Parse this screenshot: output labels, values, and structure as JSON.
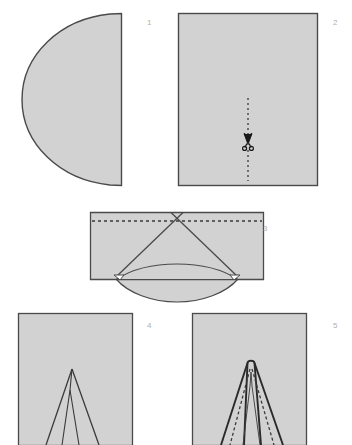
{
  "figure": {
    "background_color": "#ffffff",
    "paper_fill_color": "#d2d2d2",
    "outline_color": "#4a4a4a",
    "dashed_line_color": "#3a3a3a",
    "step_number_color": "#b0b0b0",
    "total_steps": 5
  },
  "steps": [
    {
      "number": "1",
      "name": "semicircle-half-sheet",
      "caption_position": {
        "x": 147,
        "y": 25
      },
      "shape": "semicircle",
      "description": "Half circle with straight edge on the right",
      "bounds": {
        "x": 22,
        "y": 13,
        "width": 100,
        "height": 173
      }
    },
    {
      "number": "2",
      "name": "folded-rectangle-with-cut-line",
      "caption_position": {
        "x": 333,
        "y": 25
      },
      "shape": "rectangle",
      "description": "Folded rectangle with vertical dashed cut line and scissors",
      "bounds": {
        "x": 178,
        "y": 13,
        "width": 140,
        "height": 173
      },
      "dashed_line": {
        "x": 248,
        "y1": 98,
        "y2": 180,
        "style": "dashed-vertical"
      },
      "icon": {
        "name": "scissors-icon",
        "x": 248,
        "y": 143
      }
    },
    {
      "number": "3",
      "name": "folded-band-with-triangle-fold",
      "caption_position": {
        "x": 263,
        "y": 231
      },
      "shape": "folded-band",
      "description": "Wide folded band with horizontal dashed fold line and inner triangle creases",
      "bounds": {
        "x": 90,
        "y": 212,
        "width": 175,
        "height": 80
      },
      "dashed_line": {
        "y": 221,
        "x1": 92,
        "x2": 262,
        "style": "dashed-horizontal"
      }
    },
    {
      "number": "4",
      "name": "narrow-spike-panel",
      "caption_position": {
        "x": 147,
        "y": 328
      },
      "shape": "rectangle",
      "description": "Rectangle with two thin overlapping spike creases",
      "bounds": {
        "x": 18,
        "y": 313,
        "width": 115,
        "height": 132
      }
    },
    {
      "number": "5",
      "name": "spike-panel-with-dashed-folds",
      "caption_position": {
        "x": 333,
        "y": 328
      },
      "shape": "rectangle",
      "description": "Rectangle with bold spike outline and dashed interior fold lines",
      "bounds": {
        "x": 192,
        "y": 313,
        "width": 115,
        "height": 132
      }
    }
  ]
}
